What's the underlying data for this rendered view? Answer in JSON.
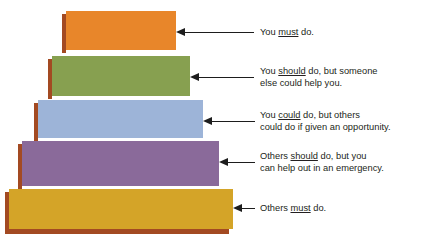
{
  "diagram": {
    "type": "pyramid",
    "background_color": "#FFFFFF",
    "shadow_color": "#A34A22",
    "arrow_color": "#1D1D1D",
    "text_color": "#231F20",
    "tiers": [
      {
        "id": "tier-1",
        "level": 1,
        "color": "#E8862A",
        "color_name": "orange",
        "label_text": "You must do.",
        "label_lines": [
          [
            {
              "t": "You ",
              "u": false
            },
            {
              "t": "must",
              "u": true
            },
            {
              "t": " do.",
              "u": false
            }
          ]
        ]
      },
      {
        "id": "tier-2",
        "level": 2,
        "color": "#87A050",
        "color_name": "green",
        "label_text": "You should do, but someone else could help you.",
        "label_lines": [
          [
            {
              "t": "You ",
              "u": false
            },
            {
              "t": "should",
              "u": true
            },
            {
              "t": " do, but someone",
              "u": false
            }
          ],
          [
            {
              "t": "else could help you.",
              "u": false
            }
          ]
        ]
      },
      {
        "id": "tier-3",
        "level": 3,
        "color": "#9DB4D8",
        "color_name": "blue",
        "label_text": "You could do, but others could do if given an opportunity.",
        "label_lines": [
          [
            {
              "t": "You ",
              "u": false
            },
            {
              "t": "could",
              "u": true
            },
            {
              "t": " do, but others",
              "u": false
            }
          ],
          [
            {
              "t": "could do if given an opportunity.",
              "u": false
            }
          ]
        ]
      },
      {
        "id": "tier-4",
        "level": 4,
        "color": "#8A6A9A",
        "color_name": "purple",
        "label_text": "Others should do, but you can help out in an emergency.",
        "label_lines": [
          [
            {
              "t": "Others ",
              "u": false
            },
            {
              "t": "should",
              "u": true
            },
            {
              "t": " do, but you",
              "u": false
            }
          ],
          [
            {
              "t": "can help out in an emergency.",
              "u": false
            }
          ]
        ]
      },
      {
        "id": "tier-5",
        "level": 5,
        "color": "#D4A428",
        "color_name": "gold",
        "label_text": "Others must do.",
        "label_lines": [
          [
            {
              "t": "Others ",
              "u": false
            },
            {
              "t": "must",
              "u": true
            },
            {
              "t": " do.",
              "u": false
            }
          ]
        ]
      }
    ]
  }
}
